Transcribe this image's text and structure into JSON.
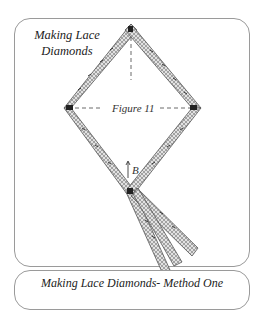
{
  "figure_card": {
    "title_line1": "Making Lace",
    "title_line2": "Diamonds",
    "figure_label": "Figure 11",
    "point_label": "B"
  },
  "method_card": {
    "title": "Making Lace Diamonds- Method One"
  },
  "colors": {
    "border": "#9a9a9a",
    "lace_fill": "#d8d8d8",
    "lace_stroke": "#555555",
    "text": "#222222"
  }
}
